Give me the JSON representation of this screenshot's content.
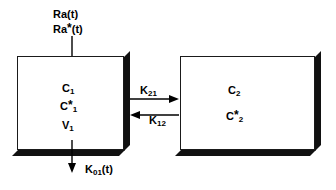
{
  "diagram": {
    "colors": {
      "stroke": "#000000",
      "shadow": "#111111",
      "background": "#ffffff"
    },
    "inputs": {
      "ra_label": "Ra(t)",
      "ra_tracer_label_prefix": "Ra",
      "ra_tracer_star": "*",
      "ra_tracer_label_suffix": "(t)"
    },
    "compartment_1": {
      "name": "Compartment 1",
      "concentration": "C",
      "concentration_sub": "1",
      "tracer_concentration": "C",
      "tracer_star": "*",
      "tracer_sub": "1",
      "volume": "V",
      "volume_sub": "1"
    },
    "compartment_2": {
      "name": "Compartment 2",
      "concentration": "C",
      "concentration_sub": "2",
      "tracer_concentration": "C",
      "tracer_star": "*",
      "tracer_sub": "2"
    },
    "rates": {
      "k21": "K",
      "k21_sub": "21",
      "k12": "K",
      "k12_sub": "12",
      "k01": "K",
      "k01_sub": "01",
      "k01_suffix": "(t)"
    }
  }
}
